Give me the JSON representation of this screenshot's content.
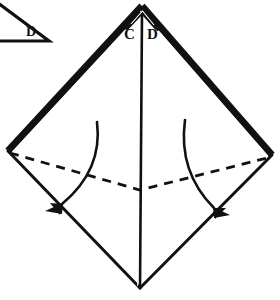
{
  "figure": {
    "type": "diagram",
    "background_color": "#ffffff",
    "line_color": "#111111",
    "labels": {
      "apex_left": "C",
      "apex_right": "D",
      "corner_triangle": "D"
    },
    "elements": {
      "outline_name": "diamond-kite-outline",
      "center_crease_name": "center-vertical-crease",
      "dashed_fold_name": "dashed-fold-line",
      "left_arrow_name": "left-fold-arrow",
      "right_arrow_name": "right-fold-arrow",
      "corner_figure_name": "corner-right-triangle"
    }
  },
  "geometry": {
    "apex": [
      142,
      6
    ],
    "left_vertex": [
      8,
      151
    ],
    "right_vertex": [
      272,
      155
    ],
    "bottom_vertex": [
      140,
      288
    ],
    "dashed_mid": [
      140,
      190
    ],
    "left_arc_start": [
      97,
      122
    ],
    "left_arc_end": [
      46,
      212
    ],
    "right_arc_start": [
      185,
      120
    ],
    "right_arc_end": [
      224,
      216
    ],
    "corner_triangle_points": "[-12,-4] [47,40] [-12,40]"
  }
}
